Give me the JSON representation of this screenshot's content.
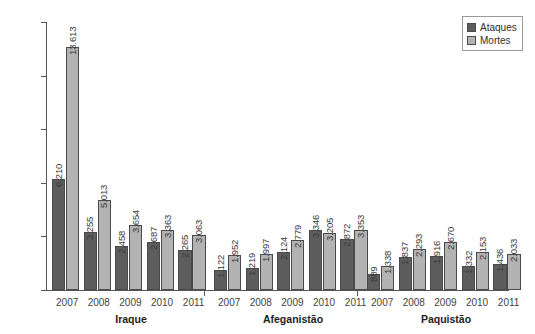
{
  "chart_data": {
    "type": "bar",
    "title": "",
    "subtitle": "",
    "xlabel": "",
    "ylabel": "",
    "ylim": [
      0,
      15000
    ],
    "grid": false,
    "legend_position": "top-right",
    "y_ticks": [
      "0",
      "3.000",
      "6.000",
      "9.000",
      "12.000",
      "15.000"
    ],
    "y_tick_values": [
      0,
      3000,
      6000,
      9000,
      12000,
      15000
    ],
    "categories": [
      "2007",
      "2008",
      "2009",
      "2010",
      "2011"
    ],
    "legend": [
      "Ataques",
      "Mortes"
    ],
    "groups": [
      {
        "name": "Iraque",
        "years": [
          "2007",
          "2008",
          "2009",
          "2010",
          "2011"
        ],
        "series": [
          {
            "name": "Ataques",
            "color": "#5d5d5d",
            "values": [
              6210,
              3255,
              2458,
              2687,
              2265
            ],
            "labels": [
              "6.210",
              "3.255",
              "2.458",
              "2.687",
              "2.265"
            ]
          },
          {
            "name": "Mortes",
            "color": "#b3b3b3",
            "values": [
              13613,
              5013,
              3654,
              3363,
              3063
            ],
            "labels": [
              "13.613",
              "5.013",
              "3.654",
              "3.363",
              "3.063"
            ]
          }
        ]
      },
      {
        "name": "Afeganistão",
        "years": [
          "2007",
          "2008",
          "2009",
          "2010",
          "2011"
        ],
        "series": [
          {
            "name": "Ataques",
            "color": "#5d5d5d",
            "values": [
              1122,
              1219,
              2124,
              3346,
              2872
            ],
            "labels": [
              "1.122",
              "1.219",
              "2.124",
              "3.346",
              "2.872"
            ]
          },
          {
            "name": "Mortes",
            "color": "#b3b3b3",
            "values": [
              1952,
              1997,
              2779,
              3205,
              3353
            ],
            "labels": [
              "1.952",
              "1.997",
              "2.779",
              "3.205",
              "3.353"
            ]
          }
        ]
      },
      {
        "name": "Paquistão",
        "years": [
          "2007",
          "2008",
          "2009",
          "2010",
          "2011"
        ],
        "series": [
          {
            "name": "Ataques",
            "color": "#5d5d5d",
            "values": [
              889,
              1837,
              1916,
              1332,
              1436
            ],
            "labels": [
              "889",
              "1.837",
              "1.916",
              "1.332",
              "1.436"
            ]
          },
          {
            "name": "Mortes",
            "color": "#b3b3b3",
            "values": [
              1338,
              2293,
              2670,
              2153,
              2033
            ],
            "labels": [
              "1.338",
              "2.293",
              "2.670",
              "2.153",
              "2.033"
            ]
          }
        ]
      }
    ]
  },
  "legend": {
    "attacks_label": "Ataques",
    "deaths_label": "Mortes"
  },
  "colors": {
    "attacks": "#5d5d5d",
    "deaths": "#b3b3b3",
    "axis": "#555555",
    "background": "#ffffff"
  }
}
